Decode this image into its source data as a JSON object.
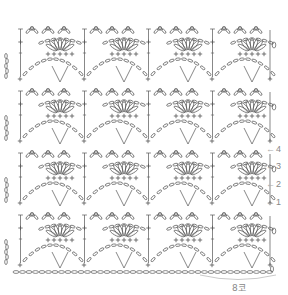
{
  "diagram": {
    "type": "crochet-stitch-chart",
    "pattern_name": "fan-shell-lace",
    "stroke_color": "#555555",
    "label_color": "#888888",
    "background": "#ffffff",
    "repeats_horizontal": 4,
    "repeats_vertical": 4,
    "repeat_width_px": 64,
    "band_height_px": 62,
    "foundation_y": 272,
    "row_markers": [
      {
        "label": "1",
        "y": 197
      },
      {
        "label": "2",
        "y": 179
      },
      {
        "label": "3",
        "y": 161
      },
      {
        "label": "4",
        "y": 144
      }
    ],
    "repeat_width_label": "8코",
    "symbols": [
      "chain-oval",
      "single-crochet-plus",
      "double-crochet-t",
      "slip-stitch"
    ]
  }
}
